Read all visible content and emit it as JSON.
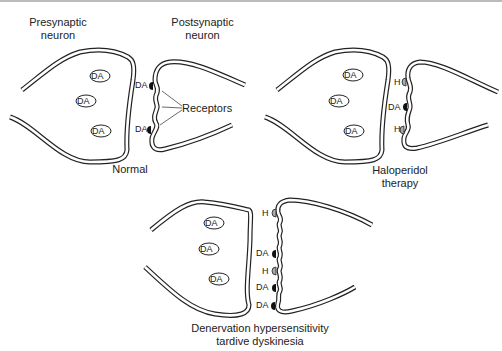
{
  "panels": [
    {
      "name": "normal",
      "caption": "Normal",
      "presynaptic_label": "Presynaptic neuron",
      "postsynaptic_label": "Postsynaptic neuron",
      "vesicles": [
        "DA",
        "DA",
        "DA"
      ],
      "receptor_labels": [
        "DA",
        "DA"
      ],
      "callout": "Receptors"
    },
    {
      "name": "haloperidol",
      "caption_line1": "Haloperidol",
      "caption_line2": "therapy",
      "vesicles": [
        "DA",
        "DA",
        "DA"
      ],
      "receptor_labels": [
        "H",
        "DA",
        "H"
      ]
    },
    {
      "name": "denervation",
      "caption_line1": "Denervation hypersensitivity",
      "caption_line2": "tardive dyskinesia",
      "vesicles": [
        "DA",
        "DA",
        "DA"
      ],
      "receptor_labels": [
        "H",
        "DA",
        "H",
        "DA",
        "DA"
      ]
    }
  ]
}
